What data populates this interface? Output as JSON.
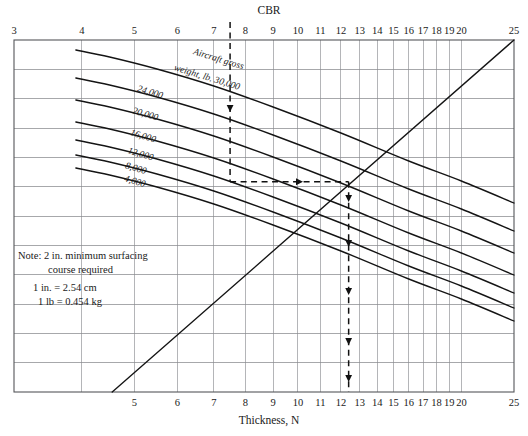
{
  "figure": {
    "top_axis_title": "CBR",
    "bottom_axis_title": "Thickness, N"
  },
  "note": {
    "line1": "Note: 2 in. minimum surfacing",
    "line2": "course required",
    "line3": "1 in. = 2.54 cm",
    "line4": "1 lb = 0.454 kg"
  },
  "curve_family_label": {
    "line1": "Aircraft gross",
    "line2": "weight, lb. 30,000"
  },
  "chart_data": {
    "type": "line",
    "xlabel": "Thickness, N",
    "ylabel": "",
    "top_axis_label": "CBR",
    "grid": true,
    "legend_position": "inline-curve-labels",
    "x_scale": "log",
    "xlim": [
      3,
      25
    ],
    "top_axis_ticks": [
      3,
      4,
      5,
      6,
      7,
      8,
      9,
      10,
      11,
      12,
      13,
      14,
      15,
      16,
      17,
      18,
      19,
      20,
      25
    ],
    "bottom_axis_ticks": [
      5,
      6,
      7,
      8,
      9,
      10,
      11,
      12,
      13,
      14,
      15,
      16,
      17,
      18,
      19,
      20,
      25
    ],
    "horizontal_gridline_count": 12,
    "series": [
      {
        "name": "Aircraft gross weight, lb. 30,000",
        "label": "Aircraft gross weight, lb. 30,000",
        "x": [
          3.9,
          4.5,
          5.5,
          7.0,
          9.0,
          12.0,
          16.0,
          20.0,
          25.0
        ],
        "y_px": [
          50,
          57,
          69,
          86,
          107,
          133,
          161,
          181,
          203
        ]
      },
      {
        "name": "24,000",
        "label": "24,000",
        "x": [
          3.9,
          4.5,
          5.5,
          7.0,
          9.0,
          12.0,
          16.0,
          20.0,
          25.0
        ],
        "y_px": [
          78,
          85,
          97,
          114,
          135,
          161,
          189,
          209,
          231
        ]
      },
      {
        "name": "20,000",
        "label": "20,000",
        "x": [
          3.9,
          4.5,
          5.5,
          7.0,
          9.0,
          12.0,
          16.0,
          20.0,
          25.0
        ],
        "y_px": [
          100,
          107,
          119,
          136,
          157,
          183,
          211,
          231,
          253
        ]
      },
      {
        "name": "16,000",
        "label": "16,000",
        "x": [
          3.9,
          4.5,
          5.5,
          7.0,
          9.0,
          12.0,
          16.0,
          20.0,
          25.0
        ],
        "y_px": [
          122,
          129,
          141,
          158,
          179,
          205,
          233,
          253,
          275
        ]
      },
      {
        "name": "12,000",
        "label": "12,000",
        "x": [
          3.9,
          4.5,
          5.5,
          7.0,
          9.0,
          12.0,
          16.0,
          20.0,
          25.0
        ],
        "y_px": [
          140,
          147,
          159,
          176,
          197,
          223,
          251,
          271,
          293
        ]
      },
      {
        "name": "8,000",
        "label": "8,000",
        "x": [
          3.9,
          4.5,
          5.5,
          7.0,
          9.0,
          12.0,
          16.0,
          20.0,
          25.0
        ],
        "y_px": [
          155,
          162,
          174,
          191,
          212,
          238,
          266,
          286,
          308
        ]
      },
      {
        "name": "4,000",
        "label": "4,000",
        "x": [
          3.9,
          4.5,
          5.5,
          7.0,
          9.0,
          12.0,
          16.0,
          20.0,
          25.0
        ],
        "y_px": [
          168,
          175,
          187,
          204,
          225,
          251,
          279,
          299,
          321
        ]
      }
    ],
    "turning_line": {
      "name": "reference diagonal",
      "from_x": 4.55,
      "from_y_px": 392,
      "to_x": 25.0,
      "to_y_px": 40
    },
    "construction_path": {
      "description": "Enter at CBR 7.5, drop to the 12,000 lb gross weight curve, read horizontally to the reference diagonal, then drop vertically to Thickness N = 12.4",
      "entry_cbr": 7.5,
      "selected_curve": "12,000",
      "result_thickness": 12.4
    }
  }
}
